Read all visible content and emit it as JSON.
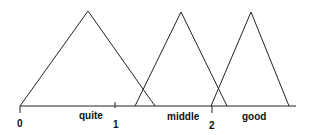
{
  "diagram": {
    "title": "",
    "type": "fuzzy-membership-functions",
    "axis": {
      "ticks": [
        {
          "label": "0",
          "x": 20
        },
        {
          "label": "1",
          "x": 115
        },
        {
          "label": "2",
          "x": 212
        }
      ]
    },
    "sets": [
      {
        "label": "quite",
        "points": [
          [
            20,
            106
          ],
          [
            88,
            11
          ],
          [
            155,
            106
          ]
        ]
      },
      {
        "label": "middle",
        "points": [
          [
            135,
            106
          ],
          [
            181,
            12
          ],
          [
            227,
            106
          ]
        ]
      },
      {
        "label": "good",
        "points": [
          [
            211,
            106
          ],
          [
            251,
            12
          ],
          [
            289,
            106
          ]
        ]
      }
    ],
    "colors": {
      "stroke": "#222222",
      "background": "#ffffff"
    }
  }
}
